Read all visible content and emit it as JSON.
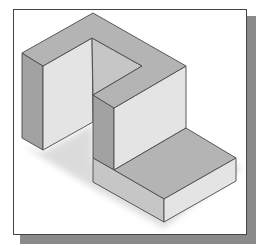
{
  "figure": {
    "colors": {
      "top_face": "#b4b4b4",
      "light_face": "#e4e4e4",
      "mid_face": "#c6c6c6",
      "dark_face": "#a2a2a2",
      "edge": "#4a4a4a",
      "frame_border": "#444444",
      "frame_shadow": "#8a8a8a"
    }
  }
}
